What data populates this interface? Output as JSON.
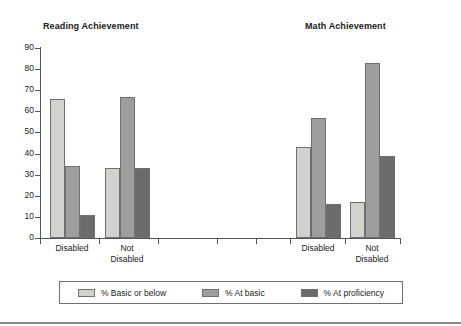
{
  "chart_data": {
    "type": "bar",
    "title": "",
    "panels": [
      {
        "title": "Reading Achievement",
        "categories": [
          "Disabled",
          "Not Disabled"
        ],
        "series": [
          {
            "name": "% Basic or below",
            "values": [
              66,
              33
            ]
          },
          {
            "name": "% At basic",
            "values": [
              34,
              67
            ]
          },
          {
            "name": "% At proficiency",
            "values": [
              11,
              33
            ]
          }
        ]
      },
      {
        "title": "Math Achievement",
        "categories": [
          "Disabled",
          "Not Disabled"
        ],
        "series": [
          {
            "name": "% Basic or below",
            "values": [
              43,
              17
            ]
          },
          {
            "name": "% At basic",
            "values": [
              57,
              83
            ]
          },
          {
            "name": "% At proficiency",
            "values": [
              16,
              39
            ]
          }
        ]
      }
    ],
    "categories": [
      "Disabled",
      "Not Disabled",
      "Disabled",
      "Not Disabled"
    ],
    "series": [
      {
        "name": "% Basic or below",
        "values": [
          66,
          33,
          43,
          17
        ]
      },
      {
        "name": "% At basic",
        "values": [
          34,
          67,
          57,
          83
        ]
      },
      {
        "name": "% At proficiency",
        "values": [
          11,
          33,
          16,
          39
        ]
      }
    ],
    "xlabel": "",
    "ylabel": "",
    "ylim": [
      0,
      90
    ],
    "yticks": [
      0,
      10,
      20,
      30,
      40,
      50,
      60,
      70,
      80,
      90
    ],
    "ytick_labels": [
      "0",
      "10",
      "20",
      "30",
      "40",
      "50",
      "60",
      "70",
      "80",
      "90"
    ],
    "grid": false,
    "legend_position": "bottom",
    "colors": {
      "series_0": "#d3d3cd",
      "series_1": "#9e9e9e",
      "series_2": "#6b6b6b",
      "axis": "#555555",
      "text": "#1a1a1a",
      "background": "#ffffff"
    }
  },
  "panels": [
    {
      "title": "Reading Achievement"
    },
    {
      "title": "Math Achievement"
    }
  ],
  "x_labels": [
    {
      "line1": "Disabled",
      "line2": ""
    },
    {
      "line1": "Not",
      "line2": "Disabled"
    },
    {
      "line1": "Disabled",
      "line2": ""
    },
    {
      "line1": "Not",
      "line2": "Disabled"
    }
  ],
  "legend": {
    "items": [
      {
        "label": "% Basic or below"
      },
      {
        "label": "% At basic"
      },
      {
        "label": "% At proficiency"
      }
    ]
  }
}
